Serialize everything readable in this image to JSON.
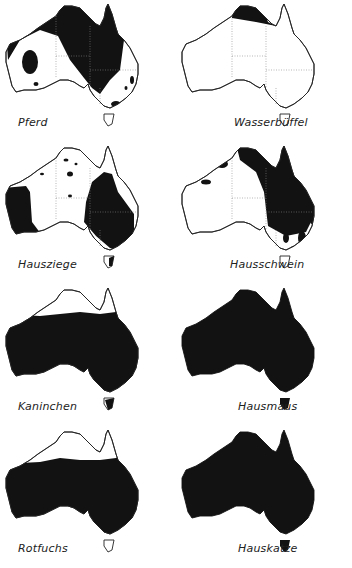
{
  "figure": {
    "type": "distribution-maps",
    "region": "Australia",
    "panels": [
      {
        "id": "pferd",
        "label": "Pferd",
        "coverage": "north, central and east interior, patches west and south-east",
        "tasmania_filled": false
      },
      {
        "id": "wasserbueffel",
        "label": "Wasserbüffel",
        "coverage": "Top End of Northern Territory only",
        "tasmania_filled": false
      },
      {
        "id": "hausziege",
        "label": "Hausziege",
        "coverage": "western Western Australia, eastern interior, scattered NT patches",
        "tasmania_filled": true
      },
      {
        "id": "hausschwein",
        "label": "Hausschwein",
        "coverage": "north coast and eastern Queensland/NSW, small south-east patches",
        "tasmania_filled": false
      },
      {
        "id": "kaninchen",
        "label": "Kaninchen",
        "coverage": "entire continent except tropical north",
        "tasmania_filled": true
      },
      {
        "id": "hausmaus",
        "label": "Hausmaus",
        "coverage": "entire continent",
        "tasmania_filled": true
      },
      {
        "id": "rotfuchs",
        "label": "Rotfuchs",
        "coverage": "entire continent except tropical north",
        "tasmania_filled": false
      },
      {
        "id": "hauskatze",
        "label": "Hauskatze",
        "coverage": "entire continent",
        "tasmania_filled": true
      }
    ]
  },
  "colors": {
    "fill": "#121212",
    "outline": "#222222",
    "background": "#ffffff",
    "state_borders": "#888888"
  }
}
